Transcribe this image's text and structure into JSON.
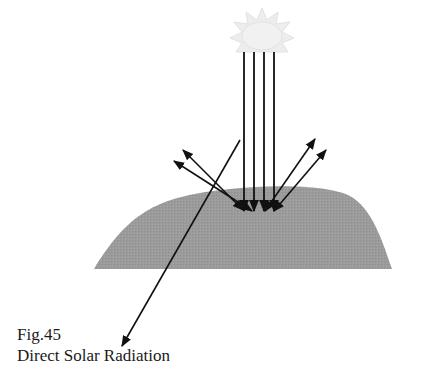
{
  "figure": {
    "number": "Fig.45",
    "title": "Direct Solar Radiation"
  },
  "diagram": {
    "elements": {
      "sun": "sun-icon",
      "ground": "hill",
      "incoming_rays": 4,
      "reflected_rays": 4,
      "long_ray": "pointer-to-caption"
    },
    "colors": {
      "hill": "#9b9b9b",
      "rays": "#111111",
      "sun": "#ececec",
      "background": "#ffffff"
    }
  }
}
